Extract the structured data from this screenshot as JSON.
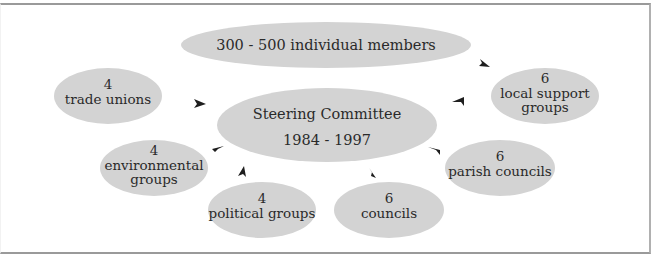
{
  "diagram": {
    "colors": {
      "node_fill": "#d3d3d3",
      "arrow": "#1e1e1e",
      "text": "#2a2a2a",
      "border": "#9a9a9a",
      "background": "#ffffff"
    },
    "center": {
      "id": "steering-committee",
      "line1": "Steering Committee",
      "line2": "1984 - 1997"
    },
    "nodes": [
      {
        "id": "individual-members",
        "line1": "300 - 500 individual members"
      },
      {
        "id": "trade-unions",
        "count": "4",
        "line1": "trade unions"
      },
      {
        "id": "local-support-groups",
        "count": "6",
        "line1": "local support",
        "line2": "groups"
      },
      {
        "id": "environmental-groups",
        "count": "4",
        "line1": "environmental",
        "line2": "groups"
      },
      {
        "id": "parish-councils",
        "count": "6",
        "line1": "parish councils"
      },
      {
        "id": "political-groups",
        "count": "4",
        "line1": "political groups"
      },
      {
        "id": "councils",
        "count": "6",
        "line1": "councils"
      }
    ],
    "edges": [
      {
        "from": "individual-members",
        "to": "local-support-groups"
      },
      {
        "from": "trade-unions",
        "to": "steering-committee"
      },
      {
        "from": "local-support-groups",
        "to": "steering-committee"
      },
      {
        "from": "environmental-groups",
        "to": "steering-committee"
      },
      {
        "from": "parish-councils",
        "to": "steering-committee"
      },
      {
        "from": "political-groups",
        "to": "steering-committee"
      },
      {
        "from": "councils",
        "to": "steering-committee"
      }
    ]
  }
}
